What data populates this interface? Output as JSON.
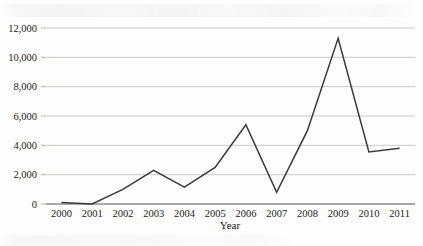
{
  "chart_data": {
    "type": "line",
    "title": "",
    "xlabel": "Year",
    "ylabel": "",
    "categories": [
      "2000",
      "2001",
      "2002",
      "2003",
      "2004",
      "2005",
      "2006",
      "2007",
      "2008",
      "2009",
      "2010",
      "2011"
    ],
    "values": [
      100,
      0,
      1000,
      2300,
      1150,
      2500,
      5400,
      800,
      5000,
      11300,
      3550,
      3800
    ],
    "series": [
      {
        "name": "",
        "values": [
          100,
          0,
          1000,
          2300,
          1150,
          2500,
          5400,
          800,
          5000,
          11300,
          3550,
          3800
        ]
      }
    ],
    "ylim": [
      0,
      12000
    ],
    "ytick_values": [
      0,
      2000,
      4000,
      6000,
      8000,
      10000,
      12000
    ],
    "ytick_labels": [
      "0",
      "2,000",
      "4,000",
      "6,000",
      "8,000",
      "10,000",
      "12,000"
    ],
    "grid": true,
    "legend": false,
    "legend_position": "none",
    "line_color": "#3a3a3a",
    "grid_color": "#c9c9c9",
    "axis_color": "#8d8d8d"
  }
}
